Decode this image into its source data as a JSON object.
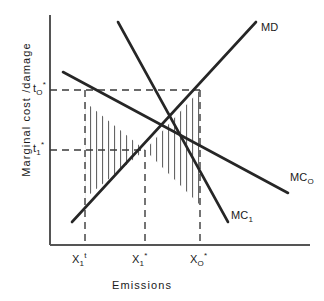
{
  "figure": {
    "kind": "economics-diagram",
    "background": "#ffffff",
    "ink_color": "#262626",
    "dash_color": "#3a3a3a",
    "hatch_color": "#555555",
    "axis_color": "#555555",
    "width": 324,
    "height": 301
  },
  "axes": {
    "y_title": "Marginal  cost /damage",
    "x_title": "Emissions",
    "y_ticks": [
      {
        "id": "t0",
        "text_main": "t",
        "sub": "O",
        "sup": "*",
        "pixel_y": 90
      },
      {
        "id": "t1",
        "text_main": "t",
        "sub": "1",
        "sup": "*",
        "pixel_y": 150
      }
    ],
    "x_ticks": [
      {
        "id": "x1t",
        "text_main": "X",
        "sub": "1",
        "sup": "t",
        "pixel_x": 85
      },
      {
        "id": "x1star",
        "text_main": "X",
        "sub": "1",
        "sup": "*",
        "pixel_x": 145
      },
      {
        "id": "x0star",
        "text_main": "X",
        "sub": "O",
        "sup": "*",
        "pixel_x": 200
      }
    ],
    "origin_px": {
      "x": 50,
      "y": 245
    },
    "x_axis_end_px": {
      "x": 310,
      "y": 245
    },
    "y_axis_top_px": {
      "x": 50,
      "y": 15
    }
  },
  "curves": [
    {
      "id": "MD",
      "label_main": "MD",
      "label_sub": "",
      "meaning": "marginal damage",
      "slope": "upward",
      "from_px": {
        "x": 72,
        "y": 222
      },
      "to_px": {
        "x": 256,
        "y": 22
      }
    },
    {
      "id": "MC0",
      "label_main": "MC",
      "label_sub": "O",
      "meaning": "marginal cost of abatement, initial technology",
      "slope": "downward",
      "from_px": {
        "x": 63,
        "y": 72
      },
      "to_px": {
        "x": 288,
        "y": 193
      }
    },
    {
      "id": "MC1",
      "label_main": "MC",
      "label_sub": "1",
      "meaning": "marginal cost of abatement, new technology",
      "slope": "downward",
      "from_px": {
        "x": 118,
        "y": 22
      },
      "to_px": {
        "x": 228,
        "y": 222
      }
    }
  ],
  "equilibria": [
    {
      "id": "E0",
      "label": "MD x MC0",
      "px": {
        "x": 200,
        "y": 90
      },
      "tax": "t0*",
      "emissions": "X0*"
    },
    {
      "id": "E1",
      "label": "MD x MC1",
      "px": {
        "x": 145,
        "y": 150
      },
      "tax": "t1*",
      "emissions": "X1*"
    }
  ],
  "guides": {
    "horizontal": [
      {
        "for": "t0",
        "from_px": {
          "x": 50,
          "y": 90
        },
        "to_px": {
          "x": 200,
          "y": 90
        }
      },
      {
        "for": "t1",
        "from_px": {
          "x": 50,
          "y": 150
        },
        "to_px": {
          "x": 145,
          "y": 150
        }
      }
    ],
    "vertical": [
      {
        "for": "x1t",
        "from_px": {
          "x": 85,
          "y": 90
        },
        "to_px": {
          "x": 85,
          "y": 245
        }
      },
      {
        "for": "x1star",
        "from_px": {
          "x": 145,
          "y": 150
        },
        "to_px": {
          "x": 145,
          "y": 245
        }
      },
      {
        "for": "x0star",
        "from_px": {
          "x": 200,
          "y": 90
        },
        "to_px": {
          "x": 200,
          "y": 245
        }
      }
    ]
  },
  "hatched_regions": [
    {
      "id": "left-triangle",
      "description": "vertically hatched triangle between MC1, t1* level and X1t vertical",
      "vertices_px": [
        [
          85,
          102
        ],
        [
          145,
          150
        ],
        [
          85,
          198
        ]
      ],
      "hatch": "vertical lines"
    },
    {
      "id": "right-triangle",
      "description": "vertically hatched triangle between MD, MC0 and X0* vertical",
      "vertices_px": [
        [
          200,
          90
        ],
        [
          145,
          150
        ],
        [
          200,
          205
        ]
      ],
      "hatch": "vertical lines"
    }
  ]
}
